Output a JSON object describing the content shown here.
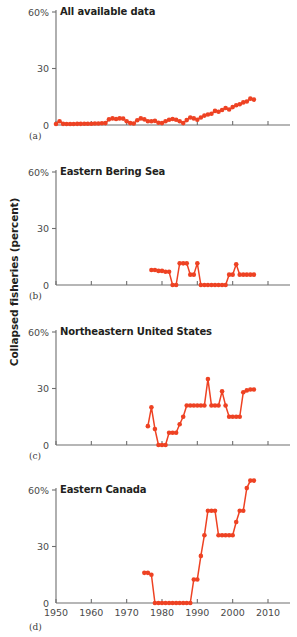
{
  "figure": {
    "ylabel": "Collapsed fisheries (percent)",
    "series_color": "#ee4223",
    "axis_color": "#6e6e6e",
    "panel_count": 4
  },
  "axes": {
    "xlim": [
      1950,
      2010
    ],
    "xticks": [
      1950,
      1960,
      1970,
      1980,
      1990,
      2000,
      2010
    ],
    "xticklabels": [
      "1950",
      "1960",
      "1970",
      "1980",
      "1990",
      "2000",
      "2010"
    ],
    "ylim": [
      0,
      60
    ],
    "yticks": [
      0,
      30,
      60
    ],
    "yticklabels": [
      "0",
      "30",
      "60%"
    ],
    "grid": false,
    "legend": "none"
  },
  "chart_data": [
    {
      "type": "line",
      "panel": "a",
      "panel_label": "(a)",
      "title": "All available data",
      "xlabel": "",
      "ylabel": "Collapsed fisheries (percent)",
      "xlim": [
        1950,
        2010
      ],
      "ylim": [
        0,
        60
      ],
      "xticks": [
        1950,
        1960,
        1970,
        1980,
        1990,
        2000,
        2010
      ],
      "yticks": [
        0,
        30,
        60
      ],
      "marker": "circle",
      "color": "#ee4223",
      "x": [
        1950,
        1951,
        1952,
        1953,
        1954,
        1955,
        1956,
        1957,
        1958,
        1959,
        1960,
        1961,
        1962,
        1963,
        1964,
        1965,
        1966,
        1967,
        1968,
        1969,
        1970,
        1971,
        1972,
        1973,
        1974,
        1975,
        1976,
        1977,
        1978,
        1979,
        1980,
        1981,
        1982,
        1983,
        1984,
        1985,
        1986,
        1987,
        1988,
        1989,
        1990,
        1991,
        1992,
        1993,
        1994,
        1995,
        1996,
        1997,
        1998,
        1999,
        2000,
        2001,
        2002,
        2003,
        2004,
        2005,
        2006
      ],
      "values": [
        0.5,
        2.0,
        0.6,
        0.5,
        0.5,
        0.5,
        0.6,
        0.6,
        0.7,
        0.7,
        0.7,
        0.8,
        0.8,
        0.9,
        1.0,
        3.0,
        3.5,
        3.2,
        3.5,
        3.4,
        2.0,
        1.0,
        0.8,
        2.5,
        3.5,
        3.0,
        2.0,
        2.0,
        2.2,
        1.2,
        1.0,
        2.0,
        2.8,
        3.2,
        2.8,
        2.0,
        1.0,
        2.6,
        4.0,
        3.5,
        2.8,
        4.0,
        5.0,
        5.6,
        6.0,
        7.5,
        7.0,
        8.0,
        9.0,
        8.2,
        9.5,
        10.5,
        11.0,
        12.0,
        12.5,
        14.0,
        13.5
      ]
    },
    {
      "type": "line",
      "panel": "b",
      "panel_label": "(b)",
      "title": "Eastern Bering Sea",
      "xlabel": "",
      "ylabel": "",
      "xlim": [
        1950,
        2010
      ],
      "ylim": [
        0,
        60
      ],
      "xticks": [
        1950,
        1960,
        1970,
        1980,
        1990,
        2000,
        2010
      ],
      "yticks": [
        0,
        30,
        60
      ],
      "marker": "circle",
      "color": "#ee4223",
      "x": [
        1977,
        1978,
        1979,
        1980,
        1981,
        1982,
        1983,
        1984,
        1985,
        1986,
        1987,
        1988,
        1989,
        1990,
        1991,
        1992,
        1993,
        1994,
        1995,
        1996,
        1997,
        1998,
        1999,
        2000,
        2001,
        2002,
        2003,
        2004,
        2005,
        2006
      ],
      "values": [
        8.0,
        8.0,
        7.5,
        7.5,
        7.0,
        7.0,
        0.0,
        0.0,
        11.5,
        11.5,
        11.5,
        5.5,
        5.5,
        11.5,
        0.0,
        0.0,
        0.0,
        0.0,
        0.0,
        0.0,
        0.0,
        0.0,
        5.5,
        5.5,
        11.0,
        5.5,
        5.5,
        5.5,
        5.5,
        5.5
      ]
    },
    {
      "type": "line",
      "panel": "c",
      "panel_label": "(c)",
      "title": "Northeastern United States",
      "xlabel": "",
      "ylabel": "",
      "xlim": [
        1950,
        2010
      ],
      "ylim": [
        0,
        60
      ],
      "xticks": [
        1950,
        1960,
        1970,
        1980,
        1990,
        2000,
        2010
      ],
      "yticks": [
        0,
        30,
        60
      ],
      "marker": "circle",
      "color": "#ee4223",
      "x": [
        1976,
        1977,
        1978,
        1979,
        1980,
        1981,
        1982,
        1983,
        1984,
        1985,
        1986,
        1987,
        1988,
        1989,
        1990,
        1991,
        1992,
        1993,
        1994,
        1995,
        1996,
        1997,
        1998,
        1999,
        2000,
        2001,
        2002,
        2003,
        2004,
        2005,
        2006
      ],
      "values": [
        10.0,
        20.0,
        8.5,
        0.0,
        0.0,
        0.0,
        6.5,
        6.5,
        6.5,
        11.0,
        15.0,
        21.0,
        21.0,
        21.0,
        21.0,
        21.0,
        21.0,
        35.0,
        21.0,
        21.0,
        21.0,
        28.5,
        21.0,
        15.0,
        15.0,
        15.0,
        15.0,
        28.0,
        29.0,
        29.5,
        29.5
      ]
    },
    {
      "type": "line",
      "panel": "d",
      "panel_label": "(d)",
      "title": "Eastern Canada",
      "xlabel": "",
      "ylabel": "",
      "xlim": [
        1950,
        2010
      ],
      "ylim": [
        0,
        70
      ],
      "xticks": [
        1950,
        1960,
        1970,
        1980,
        1990,
        2000,
        2010
      ],
      "yticks": [
        0,
        30,
        60
      ],
      "marker": "circle",
      "color": "#ee4223",
      "x": [
        1975,
        1976,
        1977,
        1978,
        1979,
        1980,
        1981,
        1982,
        1983,
        1984,
        1985,
        1986,
        1987,
        1988,
        1989,
        1990,
        1991,
        1992,
        1993,
        1994,
        1995,
        1996,
        1997,
        1998,
        1999,
        2000,
        2001,
        2002,
        2003,
        2004,
        2005,
        2006
      ],
      "values": [
        16.0,
        16.0,
        15.0,
        0.0,
        0.0,
        0.0,
        0.0,
        0.0,
        0.0,
        0.0,
        0.0,
        0.0,
        0.0,
        0.0,
        12.5,
        12.5,
        25.0,
        36.0,
        49.0,
        49.0,
        49.0,
        36.0,
        36.0,
        36.0,
        36.0,
        36.0,
        43.0,
        49.0,
        49.0,
        61.0,
        65.0,
        65.0
      ]
    }
  ]
}
